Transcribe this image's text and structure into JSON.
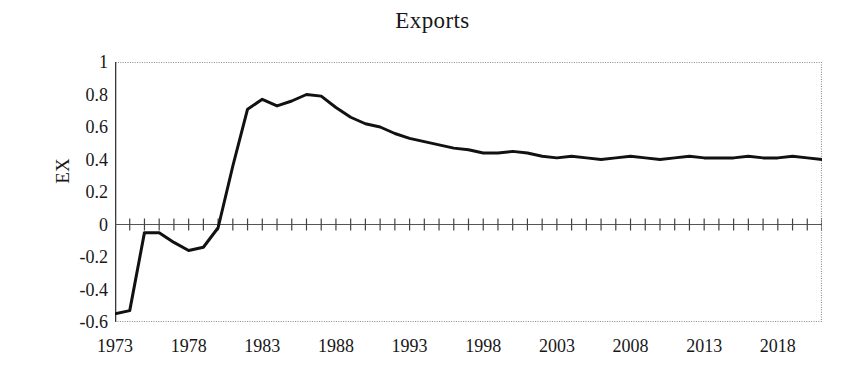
{
  "chart_data": {
    "type": "line",
    "title": "Exports",
    "xlabel": "",
    "ylabel": "EX",
    "xlim": [
      1973,
      2021
    ],
    "ylim": [
      -0.6,
      1
    ],
    "grid": false,
    "legend": "none",
    "y_ticks": [
      1,
      0.8,
      0.6,
      0.4,
      0.2,
      0,
      -0.2,
      -0.4,
      -0.6
    ],
    "y_tick_labels": [
      "1",
      "0.8",
      "0.6",
      "0.4",
      "0.2",
      "0",
      "-0.2",
      "-0.4",
      "-0.6"
    ],
    "x_ticks": [
      1973,
      1978,
      1983,
      1988,
      1993,
      1998,
      2003,
      2008,
      2013,
      2018
    ],
    "x_tick_labels": [
      "1973",
      "1978",
      "1983",
      "1988",
      "1993",
      "1998",
      "2003",
      "2008",
      "2013",
      "2018"
    ],
    "x_minor_tick_interval": 1,
    "zero_line": 0,
    "series": [
      {
        "name": "EX",
        "color": "#111111",
        "line_width": 3,
        "x": [
          1973,
          1974,
          1975,
          1976,
          1977,
          1978,
          1979,
          1980,
          1981,
          1982,
          1983,
          1984,
          1985,
          1986,
          1987,
          1988,
          1989,
          1990,
          1991,
          1992,
          1993,
          1994,
          1995,
          1996,
          1997,
          1998,
          1999,
          2000,
          2001,
          2002,
          2003,
          2004,
          2005,
          2006,
          2007,
          2008,
          2009,
          2010,
          2011,
          2012,
          2013,
          2014,
          2015,
          2016,
          2017,
          2018,
          2019,
          2020,
          2021
        ],
        "y": [
          -0.55,
          -0.53,
          -0.05,
          -0.05,
          -0.11,
          -0.16,
          -0.14,
          -0.02,
          0.36,
          0.71,
          0.77,
          0.73,
          0.76,
          0.8,
          0.79,
          0.72,
          0.66,
          0.62,
          0.6,
          0.56,
          0.53,
          0.51,
          0.49,
          0.47,
          0.46,
          0.44,
          0.44,
          0.45,
          0.44,
          0.42,
          0.41,
          0.42,
          0.41,
          0.4,
          0.41,
          0.42,
          0.41,
          0.4,
          0.41,
          0.42,
          0.41,
          0.41,
          0.41,
          0.42,
          0.41,
          0.41,
          0.42,
          0.41,
          0.4
        ]
      }
    ]
  },
  "axes": {
    "border_color": "#8a8a8a",
    "zero_line_color": "#555555",
    "tick_color": "#444444"
  }
}
